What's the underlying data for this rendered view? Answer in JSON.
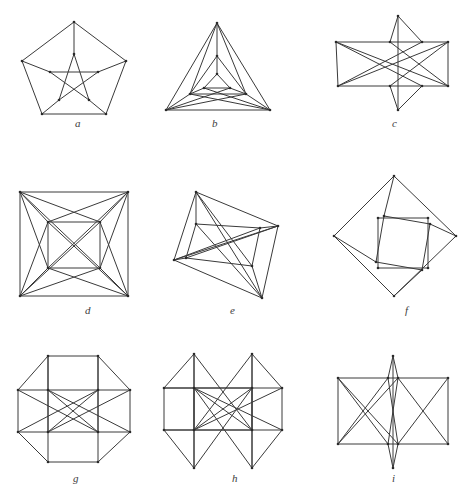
{
  "document": {
    "kind": "figure-plate",
    "background_color": "#ffffff",
    "stroke_color": "#3a3a3a",
    "label_color": "#3d3d3d",
    "width": 474,
    "height": 502,
    "partial_caption": ""
  },
  "figures": [
    {
      "id": "a",
      "label": "a",
      "label_x": 75,
      "label_y": 118,
      "box": {
        "x": 14,
        "y": 18,
        "w": 120,
        "h": 100
      },
      "view": {
        "w": 120,
        "h": 100
      },
      "description": "pentagon with inscribed pentagram",
      "vertices": [
        [
          60,
          4
        ],
        [
          8,
          43
        ],
        [
          28,
          96
        ],
        [
          92,
          96
        ],
        [
          112,
          43
        ],
        [
          60,
          36
        ],
        [
          36,
          54
        ],
        [
          45,
          82
        ],
        [
          75,
          82
        ],
        [
          84,
          54
        ]
      ],
      "edges": [
        [
          0,
          1
        ],
        [
          1,
          2
        ],
        [
          2,
          3
        ],
        [
          3,
          4
        ],
        [
          4,
          0
        ],
        [
          0,
          5
        ],
        [
          1,
          6
        ],
        [
          2,
          7
        ],
        [
          3,
          8
        ],
        [
          4,
          9
        ],
        [
          5,
          7
        ],
        [
          7,
          9
        ],
        [
          9,
          6
        ],
        [
          6,
          8
        ],
        [
          8,
          5
        ]
      ]
    },
    {
      "id": "b",
      "label": "b",
      "label_x": 212,
      "label_y": 118,
      "box": {
        "x": 160,
        "y": 18,
        "w": 115,
        "h": 100
      },
      "view": {
        "w": 115,
        "h": 100
      },
      "description": "nested triangles, triangular Petersen-style drawing",
      "vertices": [
        [
          57,
          5
        ],
        [
          6,
          92
        ],
        [
          110,
          92
        ],
        [
          57,
          38
        ],
        [
          30,
          76
        ],
        [
          86,
          76
        ],
        [
          57,
          56
        ],
        [
          44,
          70
        ],
        [
          70,
          70
        ]
      ],
      "edges": [
        [
          0,
          1
        ],
        [
          1,
          2
        ],
        [
          2,
          0
        ],
        [
          0,
          3
        ],
        [
          1,
          4
        ],
        [
          2,
          5
        ],
        [
          3,
          4
        ],
        [
          4,
          5
        ],
        [
          5,
          3
        ],
        [
          3,
          6
        ],
        [
          4,
          7
        ],
        [
          5,
          8
        ],
        [
          6,
          7
        ],
        [
          7,
          8
        ],
        [
          8,
          6
        ],
        [
          0,
          4
        ],
        [
          0,
          5
        ],
        [
          1,
          5
        ],
        [
          2,
          4
        ],
        [
          1,
          8
        ],
        [
          2,
          7
        ]
      ]
    },
    {
      "id": "c",
      "label": "c",
      "label_x": 392,
      "label_y": 118,
      "box": {
        "x": 330,
        "y": 12,
        "w": 125,
        "h": 108
      },
      "view": {
        "w": 125,
        "h": 108
      },
      "description": "crossed bowtie / star drawing with two quadrilateral wings",
      "vertices": [
        [
          68,
          4
        ],
        [
          6,
          30
        ],
        [
          8,
          74
        ],
        [
          68,
          98
        ],
        [
          118,
          30
        ],
        [
          118,
          74
        ],
        [
          60,
          30
        ],
        [
          60,
          74
        ],
        [
          92,
          30
        ],
        [
          92,
          74
        ]
      ],
      "edges": [
        [
          1,
          6
        ],
        [
          6,
          8
        ],
        [
          8,
          4
        ],
        [
          4,
          5
        ],
        [
          5,
          9
        ],
        [
          9,
          7
        ],
        [
          7,
          2
        ],
        [
          2,
          1
        ],
        [
          0,
          6
        ],
        [
          0,
          8
        ],
        [
          3,
          7
        ],
        [
          3,
          9
        ],
        [
          0,
          3
        ],
        [
          1,
          9
        ],
        [
          2,
          8
        ],
        [
          4,
          7
        ],
        [
          5,
          6
        ],
        [
          1,
          5
        ],
        [
          2,
          4
        ]
      ]
    },
    {
      "id": "d",
      "label": "d",
      "label_x": 85,
      "label_y": 305,
      "box": {
        "x": 14,
        "y": 186,
        "w": 120,
        "h": 116
      },
      "view": {
        "w": 120,
        "h": 116
      },
      "description": "outer square with concentric inner square, corners cross-linked",
      "vertices": [
        [
          6,
          6
        ],
        [
          114,
          6
        ],
        [
          114,
          110
        ],
        [
          6,
          110
        ],
        [
          34,
          36
        ],
        [
          86,
          36
        ],
        [
          86,
          82
        ],
        [
          34,
          82
        ]
      ],
      "edges": [
        [
          0,
          1
        ],
        [
          1,
          2
        ],
        [
          2,
          3
        ],
        [
          3,
          0
        ],
        [
          4,
          5
        ],
        [
          5,
          6
        ],
        [
          6,
          7
        ],
        [
          7,
          4
        ],
        [
          0,
          4
        ],
        [
          1,
          5
        ],
        [
          2,
          6
        ],
        [
          3,
          7
        ],
        [
          0,
          5
        ],
        [
          0,
          7
        ],
        [
          1,
          4
        ],
        [
          1,
          6
        ],
        [
          2,
          5
        ],
        [
          2,
          7
        ],
        [
          3,
          4
        ],
        [
          3,
          6
        ],
        [
          0,
          6
        ],
        [
          1,
          7
        ],
        [
          2,
          4
        ],
        [
          3,
          5
        ]
      ]
    },
    {
      "id": "e",
      "label": "e",
      "label_x": 230,
      "label_y": 305,
      "box": {
        "x": 160,
        "y": 186,
        "w": 128,
        "h": 120
      },
      "view": {
        "w": 128,
        "h": 120
      },
      "description": "tilted quadrilateral prism drawing with crossing diagonals",
      "vertices": [
        [
          36,
          6
        ],
        [
          118,
          40
        ],
        [
          102,
          112
        ],
        [
          14,
          74
        ],
        [
          36,
          38
        ],
        [
          100,
          42
        ],
        [
          92,
          80
        ],
        [
          26,
          72
        ]
      ],
      "edges": [
        [
          0,
          1
        ],
        [
          1,
          2
        ],
        [
          2,
          3
        ],
        [
          3,
          0
        ],
        [
          4,
          5
        ],
        [
          5,
          6
        ],
        [
          6,
          7
        ],
        [
          7,
          4
        ],
        [
          0,
          4
        ],
        [
          1,
          5
        ],
        [
          2,
          6
        ],
        [
          3,
          7
        ],
        [
          0,
          6
        ],
        [
          1,
          7
        ],
        [
          2,
          4
        ],
        [
          3,
          5
        ],
        [
          0,
          2
        ],
        [
          1,
          3
        ]
      ]
    },
    {
      "id": "f",
      "label": "f",
      "label_x": 405,
      "label_y": 305,
      "box": {
        "x": 330,
        "y": 172,
        "w": 132,
        "h": 132
      },
      "view": {
        "w": 132,
        "h": 132
      },
      "description": "outer diamond with rotated inner square nested inside an axis-aligned square",
      "vertices": [
        [
          64,
          4
        ],
        [
          126,
          64
        ],
        [
          64,
          124
        ],
        [
          4,
          64
        ],
        [
          48,
          46
        ],
        [
          98,
          46
        ],
        [
          98,
          96
        ],
        [
          48,
          96
        ],
        [
          54,
          44
        ],
        [
          100,
          52
        ],
        [
          92,
          98
        ],
        [
          46,
          90
        ]
      ],
      "edges": [
        [
          0,
          1
        ],
        [
          1,
          2
        ],
        [
          2,
          3
        ],
        [
          3,
          0
        ],
        [
          4,
          5
        ],
        [
          5,
          6
        ],
        [
          6,
          7
        ],
        [
          7,
          4
        ],
        [
          8,
          9
        ],
        [
          9,
          10
        ],
        [
          10,
          11
        ],
        [
          11,
          8
        ],
        [
          0,
          8
        ],
        [
          1,
          9
        ],
        [
          2,
          10
        ],
        [
          3,
          11
        ]
      ]
    },
    {
      "id": "g",
      "label": "g",
      "label_x": 73,
      "label_y": 473,
      "box": {
        "x": 14,
        "y": 352,
        "w": 122,
        "h": 118
      },
      "view": {
        "w": 122,
        "h": 118
      },
      "description": "octagonal drawing with full set of interior chords",
      "vertices": [
        [
          34,
          4
        ],
        [
          84,
          4
        ],
        [
          116,
          38
        ],
        [
          116,
          80
        ],
        [
          84,
          110
        ],
        [
          34,
          110
        ],
        [
          4,
          80
        ],
        [
          4,
          38
        ],
        [
          34,
          38
        ],
        [
          84,
          38
        ],
        [
          84,
          80
        ],
        [
          34,
          80
        ]
      ],
      "edges": [
        [
          0,
          1
        ],
        [
          1,
          2
        ],
        [
          2,
          3
        ],
        [
          3,
          4
        ],
        [
          4,
          5
        ],
        [
          5,
          6
        ],
        [
          6,
          7
        ],
        [
          7,
          0
        ],
        [
          8,
          9
        ],
        [
          9,
          10
        ],
        [
          10,
          11
        ],
        [
          11,
          8
        ],
        [
          0,
          8
        ],
        [
          1,
          9
        ],
        [
          2,
          9
        ],
        [
          3,
          10
        ],
        [
          4,
          10
        ],
        [
          5,
          11
        ],
        [
          6,
          11
        ],
        [
          7,
          8
        ],
        [
          0,
          11
        ],
        [
          1,
          10
        ],
        [
          8,
          10
        ],
        [
          9,
          11
        ],
        [
          7,
          10
        ],
        [
          2,
          11
        ],
        [
          6,
          9
        ],
        [
          3,
          8
        ]
      ]
    },
    {
      "id": "h",
      "label": "h",
      "label_x": 232,
      "label_y": 473,
      "box": {
        "x": 160,
        "y": 350,
        "w": 128,
        "h": 124
      },
      "view": {
        "w": 128,
        "h": 124
      },
      "description": "octagonal drawing with spike vertices and dense crossings",
      "vertices": [
        [
          34,
          4
        ],
        [
          92,
          4
        ],
        [
          122,
          38
        ],
        [
          122,
          80
        ],
        [
          92,
          118
        ],
        [
          34,
          118
        ],
        [
          4,
          80
        ],
        [
          4,
          38
        ],
        [
          34,
          38
        ],
        [
          92,
          38
        ],
        [
          92,
          80
        ],
        [
          34,
          80
        ]
      ],
      "edges": [
        [
          1,
          2
        ],
        [
          2,
          3
        ],
        [
          3,
          4
        ],
        [
          5,
          6
        ],
        [
          6,
          7
        ],
        [
          7,
          0
        ],
        [
          8,
          9
        ],
        [
          9,
          10
        ],
        [
          10,
          11
        ],
        [
          11,
          8
        ],
        [
          0,
          8
        ],
        [
          0,
          11
        ],
        [
          1,
          9
        ],
        [
          1,
          10
        ],
        [
          4,
          10
        ],
        [
          4,
          9
        ],
        [
          5,
          11
        ],
        [
          5,
          8
        ],
        [
          2,
          9
        ],
        [
          3,
          10
        ],
        [
          6,
          11
        ],
        [
          7,
          8
        ],
        [
          0,
          10
        ],
        [
          1,
          11
        ],
        [
          4,
          8
        ],
        [
          5,
          9
        ],
        [
          8,
          10
        ],
        [
          9,
          11
        ],
        [
          7,
          9
        ],
        [
          2,
          11
        ],
        [
          6,
          10
        ],
        [
          3,
          8
        ]
      ]
    },
    {
      "id": "i",
      "label": "i",
      "label_x": 392,
      "label_y": 473,
      "box": {
        "x": 330,
        "y": 352,
        "w": 126,
        "h": 120
      },
      "view": {
        "w": 126,
        "h": 120
      },
      "description": "hexagonal frame of two squares with crossing chords and apex vertices",
      "vertices": [
        [
          63,
          4
        ],
        [
          63,
          116
        ],
        [
          8,
          26
        ],
        [
          8,
          92
        ],
        [
          118,
          26
        ],
        [
          118,
          92
        ],
        [
          58,
          26
        ],
        [
          58,
          92
        ],
        [
          68,
          26
        ],
        [
          68,
          92
        ]
      ],
      "edges": [
        [
          2,
          6
        ],
        [
          6,
          8
        ],
        [
          8,
          4
        ],
        [
          3,
          7
        ],
        [
          7,
          9
        ],
        [
          9,
          5
        ],
        [
          2,
          3
        ],
        [
          4,
          5
        ],
        [
          0,
          6
        ],
        [
          0,
          8
        ],
        [
          1,
          7
        ],
        [
          1,
          9
        ],
        [
          0,
          1
        ],
        [
          2,
          9
        ],
        [
          3,
          8
        ],
        [
          2,
          7
        ],
        [
          3,
          6
        ],
        [
          4,
          9
        ],
        [
          5,
          8
        ],
        [
          6,
          9
        ],
        [
          7,
          8
        ]
      ]
    }
  ]
}
